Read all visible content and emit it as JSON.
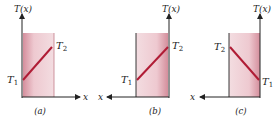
{
  "figure": {
    "panels": [
      {
        "id": "a",
        "caption": "(a)",
        "y_axis_label": "T(x)",
        "x_axis_label": "x",
        "x_direction": "right",
        "left_temp": "T",
        "left_temp_sub": "1",
        "right_temp": "T",
        "right_temp_sub": "2"
      },
      {
        "id": "b",
        "caption": "(b)",
        "y_axis_label": "T(x)",
        "x_axis_label": "x",
        "x_direction": "left",
        "left_temp": "T",
        "left_temp_sub": "1",
        "right_temp": "T",
        "right_temp_sub": "2"
      },
      {
        "id": "c",
        "caption": "(c)",
        "y_axis_label": "T(x)",
        "x_axis_label": "x",
        "x_direction": "left",
        "left_temp": "T",
        "left_temp_sub": "2",
        "right_temp": "T",
        "right_temp_sub": "1"
      }
    ],
    "colors": {
      "slab_dark": "#d99aa6",
      "slab_light": "#f6e3e7",
      "line": "#b01c35",
      "axis": "#222222"
    }
  }
}
